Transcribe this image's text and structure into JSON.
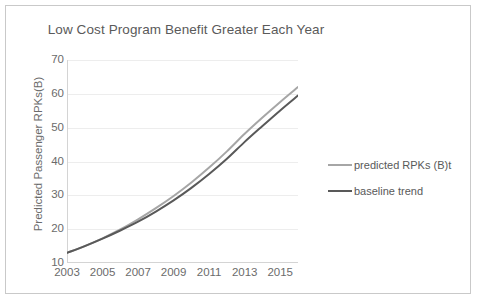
{
  "chart_data": {
    "type": "line",
    "title": "Low Cost Program Benefit Greater Each Year",
    "xlabel": "",
    "ylabel": "Predicted Passenger RPKs(B)",
    "xlim": [
      2003,
      2016
    ],
    "ylim": [
      10,
      70
    ],
    "ytick_step": 10,
    "grid": true,
    "grid_axis": "y",
    "legend_position": "right",
    "x": [
      2003,
      2004,
      2005,
      2006,
      2007,
      2008,
      2009,
      2010,
      2011,
      2012,
      2013,
      2014,
      2015,
      2016
    ],
    "ytick_labels": [
      "10",
      "20",
      "30",
      "40",
      "50",
      "60",
      "70"
    ],
    "ytick_values": [
      10,
      20,
      30,
      40,
      50,
      60,
      70
    ],
    "xtick_labels": [
      "2003",
      "2005",
      "2007",
      "2009",
      "2011",
      "2013",
      "2015"
    ],
    "xtick_values": [
      2003,
      2005,
      2007,
      2009,
      2011,
      2013,
      2015
    ],
    "series": [
      {
        "name": "predicted RPKs (B)t",
        "color": "#a6a6a6",
        "line_width": 2,
        "values": [
          13.0,
          15.0,
          17.3,
          19.9,
          22.9,
          26.2,
          29.8,
          33.8,
          38.2,
          43.0,
          48.2,
          53.0,
          57.6,
          62.0
        ]
      },
      {
        "name": "baseline trend",
        "color": "#595959",
        "line_width": 2,
        "values": [
          13.0,
          15.0,
          17.2,
          19.6,
          22.2,
          25.2,
          28.5,
          32.2,
          36.3,
          40.8,
          45.8,
          50.5,
          55.1,
          59.5
        ]
      }
    ]
  },
  "legend": {
    "items": [
      {
        "label": "predicted RPKs (B)t",
        "color": "#a6a6a6"
      },
      {
        "label": "baseline trend",
        "color": "#595959"
      }
    ]
  },
  "colors": {
    "frame_border": "#c9c9c9",
    "axis_line": "#d9d9d9",
    "grid_line": "#ededed",
    "text": "#6b6b6b",
    "title_text": "#5a5a5a"
  }
}
